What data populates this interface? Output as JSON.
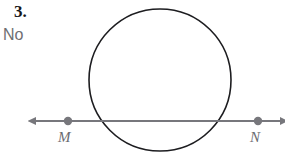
{
  "page": {
    "background_color": "#ffffff",
    "width": 285,
    "height": 154
  },
  "problem": {
    "number": "3.",
    "answer": "No"
  },
  "figure": {
    "colors": {
      "circle_stroke": "#1d1d20",
      "line_stroke": "#77777c",
      "point_fill": "#77777c",
      "label_color": "#6b6b70",
      "number_color": "#17171a",
      "answer_color": "#6e6e72"
    },
    "circle": {
      "center_x": 160,
      "center_y": 80,
      "radius": 71,
      "stroke_width": 1.6,
      "fill": "none"
    },
    "line": {
      "name": "secant-line-mn",
      "y": 121,
      "x_start": 36,
      "x_end": 280,
      "stroke_width": 2.0,
      "arrow_left": true,
      "arrow_right": true
    },
    "points": [
      {
        "name": "point-m",
        "label": "M",
        "x": 68,
        "y": 121,
        "radius": 4.2
      },
      {
        "name": "point-n",
        "label": "N",
        "x": 258,
        "y": 121,
        "radius": 4.2
      }
    ],
    "intersections": [
      {
        "x": 100,
        "y": 121
      },
      {
        "x": 225,
        "y": 121
      }
    ]
  }
}
